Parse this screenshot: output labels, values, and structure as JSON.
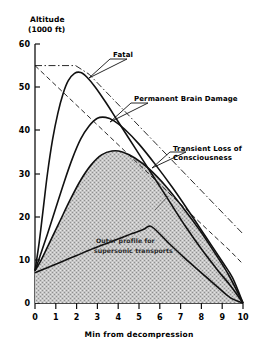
{
  "chart_data": {
    "type": "line",
    "title": "",
    "ylabel": "Altitude",
    "yunit": "(1000 ft)",
    "xlabel": "Min from decompression",
    "xlim": [
      0,
      10
    ],
    "ylim": [
      0,
      60
    ],
    "xticks": [
      0,
      1,
      2,
      3,
      4,
      5,
      6,
      7,
      8,
      9,
      10
    ],
    "yticks": [
      0,
      10,
      20,
      30,
      40,
      50,
      60
    ],
    "xtick_labels": [
      "0",
      "1",
      "2",
      "3",
      "4",
      "5",
      "6",
      "7",
      "8",
      "9",
      "10"
    ],
    "ytick_labels": [
      "0",
      "10",
      "20",
      "30",
      "40",
      "50",
      "60"
    ],
    "grid": false,
    "legend": "none",
    "series": [
      {
        "name": "Fatal",
        "style": "solid",
        "points": [
          [
            0.0,
            7.5
          ],
          [
            0.2,
            14
          ],
          [
            0.4,
            22
          ],
          [
            0.6,
            30
          ],
          [
            0.85,
            38
          ],
          [
            1.1,
            44
          ],
          [
            1.35,
            48.5
          ],
          [
            1.6,
            51.5
          ],
          [
            1.9,
            53.2
          ],
          [
            2.2,
            53.4
          ],
          [
            2.5,
            52.3
          ],
          [
            2.9,
            50.0
          ],
          [
            3.4,
            46.5
          ],
          [
            4.0,
            42.0
          ],
          [
            4.8,
            36.0
          ],
          [
            5.6,
            30.0
          ],
          [
            6.4,
            24.0
          ],
          [
            7.2,
            18.0
          ],
          [
            8.0,
            12.5
          ],
          [
            8.8,
            7.5
          ],
          [
            9.4,
            4.0
          ],
          [
            10.0,
            0.0
          ]
        ]
      },
      {
        "name": "Permanent Brain Damage",
        "style": "solid",
        "points": [
          [
            0.0,
            7.5
          ],
          [
            0.25,
            11
          ],
          [
            0.6,
            16
          ],
          [
            1.0,
            22
          ],
          [
            1.4,
            28
          ],
          [
            1.8,
            33.5
          ],
          [
            2.2,
            38
          ],
          [
            2.6,
            41
          ],
          [
            3.0,
            42.8
          ],
          [
            3.4,
            43.0
          ],
          [
            3.8,
            42.2
          ],
          [
            4.3,
            40.3
          ],
          [
            5.0,
            36.8
          ],
          [
            5.8,
            32.0
          ],
          [
            6.6,
            26.8
          ],
          [
            7.4,
            21.2
          ],
          [
            8.2,
            15.4
          ],
          [
            9.0,
            9.6
          ],
          [
            9.5,
            5.8
          ],
          [
            10.0,
            0.0
          ]
        ]
      },
      {
        "name": "Transient Loss of Consciousness",
        "style": "solid",
        "points": [
          [
            0.0,
            7.5
          ],
          [
            0.3,
            10
          ],
          [
            0.7,
            14
          ],
          [
            1.2,
            19
          ],
          [
            1.7,
            24
          ],
          [
            2.2,
            28.5
          ],
          [
            2.7,
            32
          ],
          [
            3.2,
            34.3
          ],
          [
            3.7,
            35.2
          ],
          [
            4.2,
            35.0
          ],
          [
            4.8,
            33.6
          ],
          [
            5.5,
            31.0
          ],
          [
            6.3,
            27.0
          ],
          [
            7.1,
            22.2
          ],
          [
            7.9,
            17.0
          ],
          [
            8.7,
            11.2
          ],
          [
            9.3,
            6.6
          ],
          [
            10.0,
            0.0
          ]
        ]
      },
      {
        "name": "Outer profile for supersonic transports",
        "style": "solid-filled",
        "fill": true,
        "points": [
          [
            0.0,
            7.0
          ],
          [
            0.5,
            8.0
          ],
          [
            1.2,
            9.4
          ],
          [
            2.0,
            11.0
          ],
          [
            2.8,
            12.6
          ],
          [
            3.6,
            14.1
          ],
          [
            4.4,
            15.6
          ],
          [
            5.2,
            17.0
          ],
          [
            5.6,
            17.7
          ],
          [
            6.4,
            14.0
          ],
          [
            7.2,
            10.4
          ],
          [
            8.0,
            7.0
          ],
          [
            8.8,
            3.6
          ],
          [
            9.4,
            1.2
          ],
          [
            10.0,
            0.0
          ]
        ]
      },
      {
        "name": "upper-envelope-dash-dot",
        "style": "dash-dot",
        "points": [
          [
            0.0,
            55.0
          ],
          [
            1.95,
            55.0
          ],
          [
            2.6,
            53.0
          ],
          [
            3.6,
            48.0
          ],
          [
            4.6,
            43.0
          ],
          [
            5.8,
            37.0
          ],
          [
            7.0,
            31.0
          ],
          [
            8.2,
            25.0
          ],
          [
            9.2,
            20.0
          ],
          [
            10.0,
            16.0
          ]
        ]
      },
      {
        "name": "lower-envelope-dashed",
        "style": "dashed",
        "points": [
          [
            0.0,
            55.0
          ],
          [
            1.2,
            49.5
          ],
          [
            2.4,
            44.0
          ],
          [
            3.6,
            38.5
          ],
          [
            4.8,
            33.0
          ],
          [
            6.0,
            27.5
          ],
          [
            7.2,
            22.0
          ],
          [
            8.4,
            16.5
          ],
          [
            9.4,
            12.0
          ],
          [
            10.0,
            9.0
          ]
        ]
      }
    ],
    "annotations": [
      {
        "name": "fatal",
        "text": "Fatal",
        "x": 4.2,
        "y": 56.0
      },
      {
        "name": "permanent-brain-damage",
        "text": "Permanent Brain Damage",
        "x": 6.0,
        "y": 47.0
      },
      {
        "name": "transient-loss-of-consciousness",
        "line1": "Transient Loss of",
        "line2": "Consciousness",
        "x": 6.6,
        "y": 36.5
      },
      {
        "name": "outer-profile",
        "line1": "Outer profile for",
        "line2": "supersonic transports",
        "x": 3.2,
        "y": 18.5
      }
    ],
    "colors": {
      "axis": "#111111",
      "curve": "#111111",
      "fill": "#b8b8b8",
      "background": "#ffffff"
    }
  }
}
